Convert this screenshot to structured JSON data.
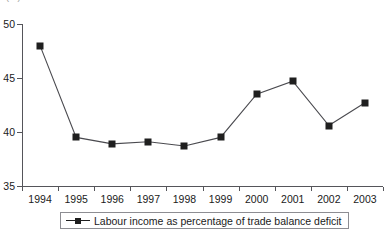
{
  "unit_label": "(%)",
  "legend": {
    "entries": [
      {
        "label": "Labour income as percentage of trade balance deficit",
        "marker": "square-marker-icon",
        "color": "#1f1f1f"
      }
    ]
  },
  "axes": {
    "y_ticks": [
      "50",
      "45",
      "40",
      "35"
    ],
    "x_ticks": [
      "1994",
      "1995",
      "1996",
      "1997",
      "1998",
      "1999",
      "2000",
      "2001",
      "2002",
      "2003"
    ]
  },
  "chart_data": {
    "type": "line",
    "title": "",
    "subtitle": "",
    "xlabel": "",
    "ylabel": "(%)",
    "categories": [
      "1994",
      "1995",
      "1996",
      "1997",
      "1998",
      "1999",
      "2000",
      "2001",
      "2002",
      "2003"
    ],
    "series": [
      {
        "name": "Labour income as percentage of trade balance deficit",
        "values": [
          48.0,
          39.5,
          38.9,
          39.1,
          38.7,
          39.5,
          43.5,
          44.7,
          40.6,
          42.7
        ],
        "color": "#1f1f1f",
        "marker": "square"
      }
    ],
    "ylim": [
      35,
      50
    ],
    "yticks": [
      35,
      40,
      45,
      50
    ],
    "grid": false,
    "legend_position": "bottom"
  }
}
